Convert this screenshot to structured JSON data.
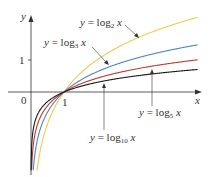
{
  "chart_data": {
    "type": "line",
    "title": "",
    "xlabel": "x",
    "ylabel": "y",
    "xlim": [
      0,
      5.1
    ],
    "ylim": [
      -2.45,
      2.8
    ],
    "grid": false,
    "legend": "inline labels with pointer lines",
    "x_ticks": [
      {
        "value": 1,
        "label": "1"
      }
    ],
    "y_ticks": [
      {
        "value": 1,
        "label": "1"
      }
    ],
    "origin_label": "0",
    "series": [
      {
        "name": "y = log₂ x",
        "base": 2,
        "color": "#f2c94c",
        "x": [
          0.18,
          0.25,
          0.5,
          1,
          2,
          3,
          4,
          5
        ],
        "values": [
          -2.47,
          -2.0,
          -1.0,
          0,
          1.0,
          1.58,
          2.0,
          2.32
        ],
        "label": {
          "prefix": "y = log",
          "sub": "2",
          "suffix": " x"
        }
      },
      {
        "name": "y = log₃ x",
        "base": 3,
        "color": "#4a86c8",
        "x": [
          0.1,
          0.25,
          0.5,
          1,
          2,
          3,
          4,
          5
        ],
        "values": [
          -2.1,
          -1.26,
          -0.63,
          0,
          0.63,
          1.0,
          1.26,
          1.46
        ],
        "label": {
          "prefix": "y = log",
          "sub": "3",
          "suffix": " x"
        }
      },
      {
        "name": "y = log₅ x",
        "base": 5,
        "color": "#c0392b",
        "x": [
          0.05,
          0.25,
          0.5,
          1,
          2,
          3,
          4,
          5
        ],
        "values": [
          -1.86,
          -0.86,
          -0.43,
          0,
          0.43,
          0.68,
          0.86,
          1.0
        ],
        "label": {
          "prefix": "y = log",
          "sub": "5",
          "suffix": " x"
        }
      },
      {
        "name": "y = log₁₀ x",
        "base": 10,
        "color": "#1a1a1a",
        "x": [
          0.005,
          0.25,
          0.5,
          1,
          2,
          3,
          4,
          5
        ],
        "values": [
          -2.3,
          -0.6,
          -0.3,
          0,
          0.3,
          0.48,
          0.6,
          0.7
        ],
        "label": {
          "prefix": "y = log",
          "sub": "10",
          "suffix": " x"
        }
      }
    ],
    "annotations": [
      {
        "text": "y = log₂ x",
        "points_to": "log2 curve"
      },
      {
        "text": "y = log₃ x",
        "points_to": "log3 curve"
      },
      {
        "text": "y = log₅ x",
        "points_to": "log5 curve"
      },
      {
        "text": "y = log₁₀ x",
        "points_to": "log10 curve"
      }
    ]
  },
  "axes": {
    "x_label": "x",
    "y_label": "y",
    "origin": "0",
    "x_tick_1": "1",
    "y_tick_1": "1"
  }
}
